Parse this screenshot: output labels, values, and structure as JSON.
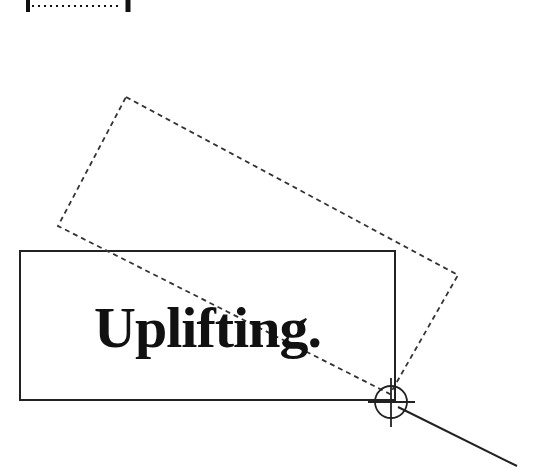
{
  "canvas": {
    "width": 543,
    "height": 468,
    "background": "#ffffff"
  },
  "text_box": {
    "label": "Uplifting.",
    "stroke": "#222222",
    "x": 20,
    "y": 251,
    "width": 375,
    "height": 149
  },
  "rotated_outline": {
    "style": "dashed",
    "points": [
      [
        126,
        97
      ],
      [
        458,
        275
      ],
      [
        390,
        394
      ],
      [
        58,
        226
      ]
    ]
  },
  "rotation_handle": {
    "icon": "crosshair-icon",
    "cx": 391,
    "cy": 402,
    "radius": 16
  },
  "pointer_line": {
    "from": [
      391,
      402
    ],
    "to": [
      517,
      466
    ]
  },
  "top_fragment": {
    "icon": "ruler-bracket-icon"
  }
}
